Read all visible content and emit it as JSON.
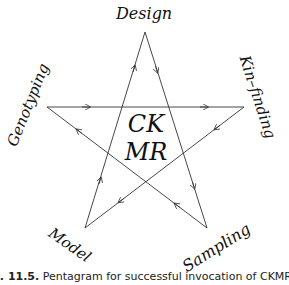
{
  "diagram": {
    "title": "Pentagram",
    "center_label": {
      "line1": "CK",
      "line2": "MR"
    },
    "vertices": [
      {
        "id": "design",
        "label": "Design",
        "x": 145,
        "y": 32
      },
      {
        "id": "kin_finding",
        "label": "Kin–finding",
        "x": 244,
        "y": 107
      },
      {
        "id": "sampling",
        "label": "Sampling",
        "x": 207,
        "y": 228
      },
      {
        "id": "model",
        "label": "Model",
        "x": 85,
        "y": 228
      },
      {
        "id": "genotyping",
        "label": "Genotyping",
        "x": 47,
        "y": 107
      }
    ],
    "edges": [
      {
        "from": "design",
        "to": "sampling"
      },
      {
        "from": "sampling",
        "to": "genotyping"
      },
      {
        "from": "genotyping",
        "to": "kin_finding"
      },
      {
        "from": "kin_finding",
        "to": "model"
      },
      {
        "from": "model",
        "to": "design"
      }
    ],
    "line_color": "#333333"
  },
  "caption": {
    "figure_number": "g. 11.5.",
    "text": "Pentagram for successful invocation of CKMR. Arrows show"
  }
}
